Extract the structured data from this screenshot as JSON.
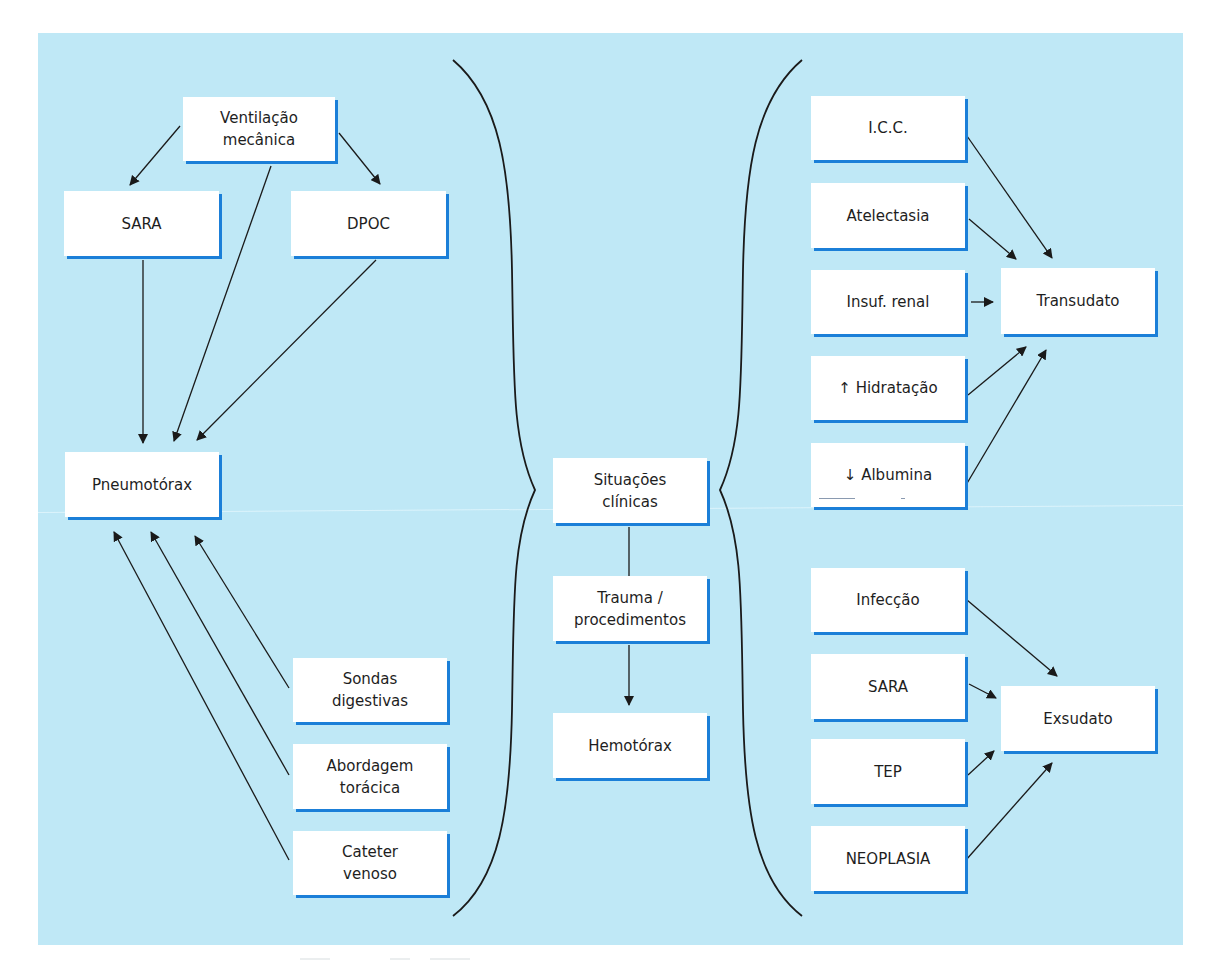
{
  "diagram": {
    "background_color": "#bfe8f6",
    "box_fill_color": "#ffffff",
    "box_shadow_color": "#1b7fd8",
    "line_color": "#1a1a1a",
    "center": {
      "root": "Situações\nclínicas",
      "trauma": "Trauma /\nprocedimentos",
      "hemotorax": "Hemotórax"
    },
    "left_branch": {
      "ventilacao": "Ventilação\nmecânica",
      "sara": "SARA",
      "dpoc": "DPOC",
      "pneumotorax": "Pneumotórax",
      "sondas": "Sondas\ndigestivas",
      "abordagem": "Abordagem\ntorácica",
      "cateter": "Cateter\nvenoso"
    },
    "right_branch": {
      "icc": "I.C.C.",
      "atelectasia": "Atelectasia",
      "insuf_renal": "Insuf. renal",
      "hidratacao": "↑ Hidratação",
      "albumina": "↓ Albumina",
      "transudato": "Transudato",
      "infeccao": "Infecção",
      "sara": "SARA",
      "tep": "TEP",
      "neoplasia": "NEOPLASIA",
      "exsudato": "Exsudato"
    },
    "edges": [
      {
        "from": "Ventilação mecânica",
        "to": "SARA"
      },
      {
        "from": "Ventilação mecânica",
        "to": "DPOC"
      },
      {
        "from": "Ventilação mecânica",
        "to": "Pneumotórax"
      },
      {
        "from": "SARA",
        "to": "Pneumotórax"
      },
      {
        "from": "DPOC",
        "to": "Pneumotórax"
      },
      {
        "from": "Sondas digestivas",
        "to": "Pneumotórax"
      },
      {
        "from": "Abordagem torácica",
        "to": "Pneumotórax"
      },
      {
        "from": "Cateter venoso",
        "to": "Pneumotórax"
      },
      {
        "from": "Situações clínicas",
        "to": "Trauma / procedimentos",
        "arrow": false
      },
      {
        "from": "Trauma / procedimentos",
        "to": "Hemotórax"
      },
      {
        "from": "I.C.C.",
        "to": "Transudato"
      },
      {
        "from": "Atelectasia",
        "to": "Transudato"
      },
      {
        "from": "Insuf. renal",
        "to": "Transudato"
      },
      {
        "from": "↑ Hidratação",
        "to": "Transudato"
      },
      {
        "from": "↓ Albumina",
        "to": "Transudato"
      },
      {
        "from": "Infecção",
        "to": "Exsudato"
      },
      {
        "from": "SARA",
        "to": "Exsudato"
      },
      {
        "from": "TEP",
        "to": "Exsudato"
      },
      {
        "from": "NEOPLASIA",
        "to": "Exsudato"
      }
    ]
  }
}
